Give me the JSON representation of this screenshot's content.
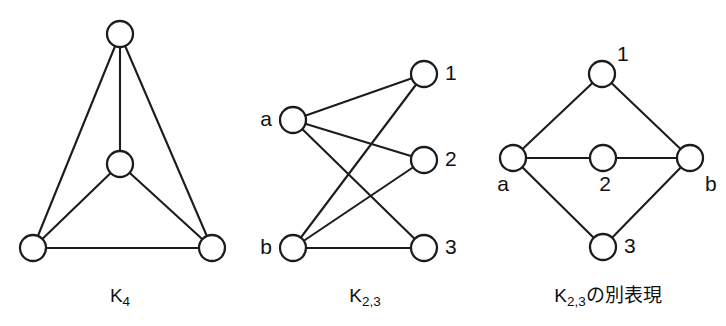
{
  "figure": {
    "background_color": "#ffffff",
    "stroke_color": "#1c1c1c",
    "node_fill": "#ffffff",
    "width": 726,
    "height": 326
  },
  "panels": [
    {
      "id": "k4",
      "caption_main": "K",
      "caption_sub": "4",
      "caption_x": 120,
      "caption_y": 297,
      "nodes": [
        {
          "id": "top",
          "label": "",
          "label_pos": "none",
          "cx": 120,
          "cy": 34,
          "r": 13
        },
        {
          "id": "center",
          "label": "",
          "label_pos": "none",
          "cx": 120,
          "cy": 164,
          "r": 13
        },
        {
          "id": "bl",
          "label": "",
          "label_pos": "none",
          "cx": 33,
          "cy": 248,
          "r": 13
        },
        {
          "id": "br",
          "label": "",
          "label_pos": "none",
          "cx": 212,
          "cy": 248,
          "r": 13
        }
      ],
      "edges": [
        {
          "from": "top",
          "to": "center"
        },
        {
          "from": "top",
          "to": "bl"
        },
        {
          "from": "top",
          "to": "br"
        },
        {
          "from": "center",
          "to": "bl"
        },
        {
          "from": "center",
          "to": "br"
        },
        {
          "from": "bl",
          "to": "br"
        }
      ]
    },
    {
      "id": "k23",
      "caption_main": "K",
      "caption_sub": "2,3",
      "caption_x": 365,
      "caption_y": 297,
      "nodes": [
        {
          "id": "a",
          "label": "a",
          "label_pos": "left",
          "cx": 293,
          "cy": 120,
          "r": 13
        },
        {
          "id": "b",
          "label": "b",
          "label_pos": "left",
          "cx": 293,
          "cy": 248,
          "r": 13
        },
        {
          "id": "1",
          "label": "1",
          "label_pos": "right",
          "cx": 424,
          "cy": 74,
          "r": 13
        },
        {
          "id": "2",
          "label": "2",
          "label_pos": "right",
          "cx": 424,
          "cy": 160,
          "r": 13
        },
        {
          "id": "3",
          "label": "3",
          "label_pos": "right",
          "cx": 424,
          "cy": 248,
          "r": 13
        }
      ],
      "edges": [
        {
          "from": "a",
          "to": "1"
        },
        {
          "from": "a",
          "to": "2"
        },
        {
          "from": "a",
          "to": "3"
        },
        {
          "from": "b",
          "to": "1"
        },
        {
          "from": "b",
          "to": "2"
        },
        {
          "from": "b",
          "to": "3"
        }
      ]
    },
    {
      "id": "k23-alt",
      "caption_main": "K",
      "caption_sub": "2,3",
      "caption_suffix": "の別表現",
      "caption_x": 608,
      "caption_y": 297,
      "nodes": [
        {
          "id": "1",
          "label": "1",
          "label_pos": "top-right",
          "cx": 602,
          "cy": 74,
          "r": 13
        },
        {
          "id": "a",
          "label": "a",
          "label_pos": "bottom-left",
          "cx": 513,
          "cy": 158,
          "r": 13
        },
        {
          "id": "2",
          "label": "2",
          "label_pos": "bottom",
          "cx": 603,
          "cy": 158,
          "r": 13
        },
        {
          "id": "b",
          "label": "b",
          "label_pos": "bottom-right",
          "cx": 690,
          "cy": 158,
          "r": 13
        },
        {
          "id": "3",
          "label": "3",
          "label_pos": "right",
          "cx": 603,
          "cy": 247,
          "r": 13
        }
      ],
      "edges": [
        {
          "from": "a",
          "to": "1"
        },
        {
          "from": "1",
          "to": "b"
        },
        {
          "from": "a",
          "to": "2"
        },
        {
          "from": "2",
          "to": "b"
        },
        {
          "from": "a",
          "to": "3"
        },
        {
          "from": "3",
          "to": "b"
        }
      ]
    }
  ]
}
